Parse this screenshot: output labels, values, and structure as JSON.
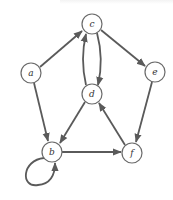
{
  "diagram": {
    "type": "directed-graph",
    "colors": {
      "edge": "#5a5a5a",
      "node_stroke": "#6a6a6a",
      "node_fill": "#ffffff",
      "label": "#333333"
    },
    "nodes": [
      {
        "id": "a",
        "label": "a",
        "x": 31,
        "y": 73
      },
      {
        "id": "b",
        "label": "b",
        "x": 52,
        "y": 152
      },
      {
        "id": "c",
        "label": "c",
        "x": 92,
        "y": 24
      },
      {
        "id": "d",
        "label": "d",
        "x": 92,
        "y": 94
      },
      {
        "id": "e",
        "label": "e",
        "x": 155,
        "y": 72
      },
      {
        "id": "f",
        "label": "f",
        "x": 132,
        "y": 153
      }
    ],
    "edges": [
      {
        "from": "a",
        "to": "c"
      },
      {
        "from": "a",
        "to": "b"
      },
      {
        "from": "c",
        "to": "d"
      },
      {
        "from": "d",
        "to": "c"
      },
      {
        "from": "c",
        "to": "e"
      },
      {
        "from": "d",
        "to": "b"
      },
      {
        "from": "e",
        "to": "f"
      },
      {
        "from": "f",
        "to": "d"
      },
      {
        "from": "b",
        "to": "f"
      },
      {
        "from": "b",
        "to": "b"
      }
    ]
  }
}
